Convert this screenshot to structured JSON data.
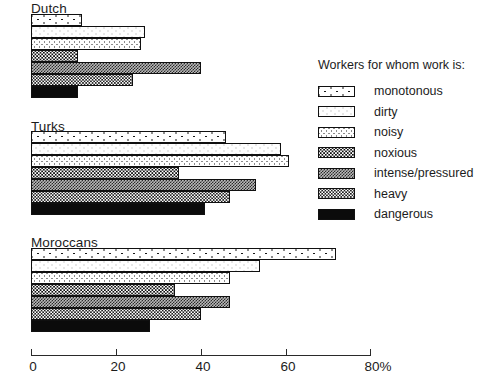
{
  "chart_data": {
    "type": "bar",
    "orientation": "horizontal",
    "title": "",
    "xlabel": "",
    "ylabel": "",
    "xlim": [
      0,
      80
    ],
    "xticks": [
      0,
      20,
      40,
      60,
      80
    ],
    "xtick_labels": [
      "0",
      "20",
      "40",
      "60",
      "80%"
    ],
    "grid": false,
    "legend_position": "right",
    "legend_title": "Workers for whom work is:",
    "categories": [
      "Dutch",
      "Turks",
      "Moroccans"
    ],
    "series": [
      {
        "name": "monotonous",
        "pattern": "sparse-dots",
        "values": [
          12,
          46,
          72
        ]
      },
      {
        "name": "dirty",
        "pattern": "medium-dots",
        "values": [
          27,
          59,
          54
        ]
      },
      {
        "name": "noisy",
        "pattern": "dense-dots",
        "values": [
          26,
          61,
          47
        ]
      },
      {
        "name": "noxious",
        "pattern": "fine-dots",
        "values": [
          11,
          35,
          34
        ]
      },
      {
        "name": "intense/pressured",
        "pattern": "grey-checker",
        "values": [
          40,
          53,
          47
        ]
      },
      {
        "name": "heavy",
        "pattern": "dark-checker",
        "values": [
          24,
          47,
          40
        ]
      },
      {
        "name": "dangerous",
        "pattern": "solid-black",
        "values": [
          11,
          41,
          28
        ]
      }
    ]
  },
  "groups": [
    {
      "label": "Dutch"
    },
    {
      "label": "Turks"
    },
    {
      "label": "Moroccans"
    }
  ],
  "legend": {
    "title": "Workers for whom work is:",
    "items": [
      {
        "label": "monotonous"
      },
      {
        "label": "dirty"
      },
      {
        "label": "noisy"
      },
      {
        "label": "noxious"
      },
      {
        "label": "intense/pressured"
      },
      {
        "label": "heavy"
      },
      {
        "label": "dangerous"
      }
    ]
  },
  "axis": {
    "ticks": [
      {
        "label": "0"
      },
      {
        "label": "20"
      },
      {
        "label": "40"
      },
      {
        "label": "60"
      },
      {
        "label": "80%"
      }
    ]
  }
}
